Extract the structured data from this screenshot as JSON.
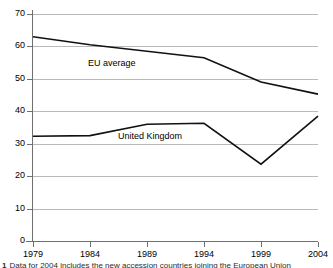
{
  "chart_data": {
    "type": "line",
    "title": "",
    "subtitle": "",
    "xlabel": "",
    "ylabel": "",
    "x": [
      1979,
      1984,
      1989,
      1994,
      1999,
      2004
    ],
    "xtick_labels": [
      "1979",
      "1984",
      "1989",
      "1994",
      "1999",
      "2004"
    ],
    "ytick_labels": [
      "0",
      "10",
      "20",
      "30",
      "40",
      "50",
      "60",
      "70"
    ],
    "yticks": [
      0,
      10,
      20,
      30,
      40,
      50,
      60,
      70
    ],
    "xlim": [
      1979,
      2004
    ],
    "ylim": [
      0,
      70
    ],
    "grid": "horizontal",
    "legend_position": "inline-annotations",
    "series": [
      {
        "name": "EU average",
        "values": [
          63.0,
          60.5,
          58.5,
          56.5,
          49.0,
          45.3
        ],
        "color": "#111111",
        "label_text": "EU average"
      },
      {
        "name": "United Kingdom",
        "values": [
          32.3,
          32.5,
          36.0,
          36.3,
          23.7,
          38.5
        ],
        "color": "#111111",
        "label_text": "United Kingdom"
      }
    ],
    "annotations": [
      {
        "text": "EU average",
        "series": "EU average"
      },
      {
        "text": "United Kingdom",
        "series": "United Kingdom"
      }
    ]
  },
  "footnote": {
    "number": "1",
    "text": "Data for 2004 includes the new accession countries joining the European Union"
  }
}
